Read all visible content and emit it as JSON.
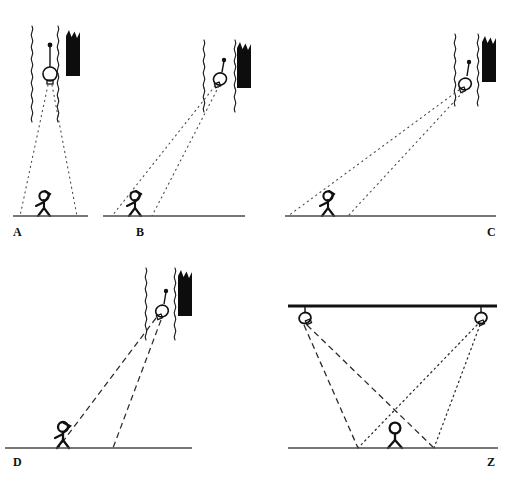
{
  "figure": {
    "background_color": "#ffffff",
    "ink_color": "#111111",
    "width": 510,
    "height": 481
  },
  "panels": [
    {
      "id": "A",
      "label": "A",
      "description": "Lamp hangs directly above observer; narrow dotted ray cone falls straight down",
      "ray_style": "dotted",
      "ground": {
        "x1": 13,
        "y1": 216,
        "x2": 88,
        "y2": 216
      },
      "lamp": {
        "x": 50,
        "y": 74,
        "stem_top_y": 45
      },
      "observer": {
        "x": 44,
        "y": 216,
        "head_y": 193
      },
      "window": {
        "left_x": 32,
        "right_x": 58,
        "top_y": 26,
        "bottom_y": 100
      },
      "dark_shape": {
        "x": 66,
        "y": 30,
        "width": 16,
        "height": 48
      },
      "rays": [
        {
          "from_x": 48,
          "from_y": 84,
          "to_x": 20,
          "to_y": 216
        },
        {
          "from_x": 52,
          "from_y": 84,
          "to_x": 77,
          "to_y": 216
        }
      ]
    },
    {
      "id": "B",
      "label": "B",
      "description": "Lamp up and to the right of observer; dotted rays angle down-left",
      "ray_style": "dotted",
      "ground": {
        "x1": 103,
        "y1": 216,
        "x2": 245,
        "y2": 216
      },
      "lamp": {
        "x": 221,
        "y": 79,
        "stem_top_y": 60
      },
      "observer": {
        "x": 135,
        "y": 216,
        "head_y": 193
      },
      "window": {
        "left_x": 204,
        "right_x": 235,
        "top_y": 40,
        "bottom_y": 108
      },
      "dark_shape": {
        "x": 237,
        "y": 42,
        "width": 14,
        "height": 46
      },
      "rays": [
        {
          "from_x": 217,
          "from_y": 87,
          "to_x": 112,
          "to_y": 216
        },
        {
          "from_x": 221,
          "from_y": 87,
          "to_x": 152,
          "to_y": 216
        }
      ]
    },
    {
      "id": "C",
      "label": "C",
      "description": "Lamp far up-right; long shallow dotted rays sweep down to the observer at far left",
      "ray_style": "dotted",
      "ground": {
        "x1": 285,
        "y1": 216,
        "x2": 496,
        "y2": 216
      },
      "lamp": {
        "x": 466,
        "y": 84,
        "stem_top_y": 62
      },
      "observer": {
        "x": 328,
        "y": 216,
        "head_y": 193
      },
      "window": {
        "left_x": 455,
        "right_x": 478,
        "top_y": 34,
        "bottom_y": 110
      },
      "dark_shape": {
        "x": 482,
        "y": 36,
        "width": 14,
        "height": 46
      },
      "rays": [
        {
          "from_x": 461,
          "from_y": 92,
          "to_x": 288,
          "to_y": 216
        },
        {
          "from_x": 466,
          "from_y": 92,
          "to_x": 348,
          "to_y": 216
        }
      ]
    },
    {
      "id": "D",
      "label": "D",
      "description": "Same geometry as B but rays drawn as long dashes instead of dots",
      "ray_style": "dashed",
      "ground": {
        "x1": 5,
        "y1": 448,
        "x2": 192,
        "y2": 448
      },
      "lamp": {
        "x": 163,
        "y": 311,
        "stem_top_y": 291
      },
      "observer": {
        "x": 63,
        "y": 448,
        "head_y": 423
      },
      "window": {
        "left_x": 146,
        "right_x": 175,
        "top_y": 268,
        "bottom_y": 340
      },
      "dark_shape": {
        "x": 178,
        "y": 270,
        "width": 14,
        "height": 46
      },
      "rays": [
        {
          "from_x": 158,
          "from_y": 320,
          "to_x": 58,
          "to_y": 448
        },
        {
          "from_x": 163,
          "from_y": 320,
          "to_x": 113,
          "to_y": 448
        }
      ]
    },
    {
      "id": "Z",
      "label": "Z",
      "description": "Two ceiling lamps; dashed cone from left lamp and dotted cone from right lamp cross over the observer",
      "ray_style": "dashed+dotted",
      "ceiling": {
        "x1": 288,
        "y1": 306,
        "x2": 497,
        "y2": 306
      },
      "ground": {
        "x1": 288,
        "y1": 448,
        "x2": 498,
        "y2": 448
      },
      "lamp_left": {
        "x": 305,
        "y": 318
      },
      "lamp_right": {
        "x": 481,
        "y": 318
      },
      "observer": {
        "x": 395,
        "y": 448,
        "head_y": 424
      },
      "rays_dashed": [
        {
          "from_x": 305,
          "from_y": 325,
          "to_x": 358,
          "to_y": 448
        },
        {
          "from_x": 307,
          "from_y": 325,
          "to_x": 434,
          "to_y": 448
        }
      ],
      "rays_dotted": [
        {
          "from_x": 479,
          "from_y": 325,
          "to_x": 358,
          "to_y": 448
        },
        {
          "from_x": 481,
          "from_y": 325,
          "to_x": 434,
          "to_y": 448
        }
      ]
    }
  ]
}
